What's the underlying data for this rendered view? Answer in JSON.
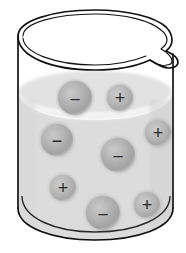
{
  "figure": {
    "background_color": "#ffffff",
    "width": 186,
    "height": 253
  },
  "beaker": {
    "name": "beaker",
    "outline_color": "#1a1a1a",
    "glass_fill": "#ffffff",
    "has_spout": true,
    "spout_side": "right",
    "rim_label": "beaker rim",
    "wall_left_x": 18,
    "wall_right_x": 173,
    "rim_top_y": 10,
    "base_bottom_y": 240
  },
  "liquid": {
    "name": "liquid-solution",
    "fill_color": "#dcdcdc",
    "surface_highlight_color": "#f0f0f0",
    "surface_top_y": 74,
    "bottom_y": 238,
    "label": "solution"
  },
  "ions": [
    {
      "id": "ion-1",
      "charge": "-",
      "symbol": "−",
      "size": "large",
      "cx": 75,
      "cy": 98,
      "r": 17,
      "fill": "#b4b4b4"
    },
    {
      "id": "ion-2",
      "charge": "+",
      "symbol": "+",
      "size": "small",
      "cx": 120,
      "cy": 98,
      "r": 13,
      "fill": "#b4b4b4"
    },
    {
      "id": "ion-3",
      "charge": "-",
      "symbol": "−",
      "size": "large",
      "cx": 57,
      "cy": 140,
      "r": 16,
      "fill": "#b4b4b4"
    },
    {
      "id": "ion-4",
      "charge": "+",
      "symbol": "+",
      "size": "small",
      "cx": 158,
      "cy": 133,
      "r": 13,
      "fill": "#b4b4b4"
    },
    {
      "id": "ion-5",
      "charge": "-",
      "symbol": "−",
      "size": "large",
      "cx": 118,
      "cy": 155,
      "r": 17,
      "fill": "#b4b4b4"
    },
    {
      "id": "ion-6",
      "charge": "+",
      "symbol": "+",
      "size": "small",
      "cx": 63,
      "cy": 188,
      "r": 13,
      "fill": "#b4b4b4"
    },
    {
      "id": "ion-7",
      "charge": "+",
      "symbol": "+",
      "size": "small",
      "cx": 147,
      "cy": 205,
      "r": 13,
      "fill": "#b4b4b4"
    },
    {
      "id": "ion-8",
      "charge": "-",
      "symbol": "−",
      "size": "large",
      "cx": 103,
      "cy": 213,
      "r": 17,
      "fill": "#b4b4b4"
    }
  ],
  "counts": {
    "negative_ions": 4,
    "positive_ions": 4,
    "total_ions": 8
  }
}
